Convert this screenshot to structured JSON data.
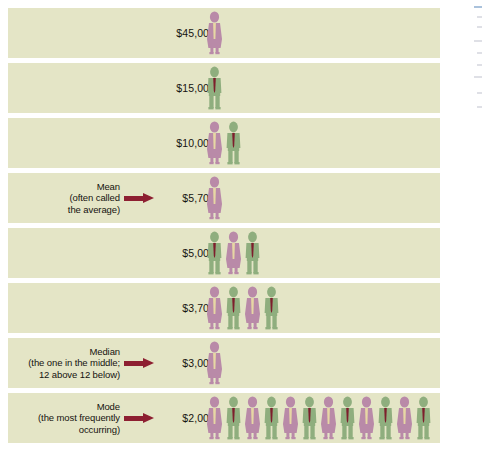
{
  "figure": {
    "name": "mean-median-mode-salary-pictograph",
    "background_color": "#ffffff",
    "band_color": "#e4e5c6",
    "arrow_color": "#8d1f31",
    "female_color": "#b98aa8",
    "female_blouse_color": "#e7d7a4",
    "male_color": "#8fae7e",
    "male_tie_color": "#7d1e2c",
    "text_color": "#15130f"
  },
  "chart_data": {
    "type": "bar",
    "title": "",
    "subtitle": "",
    "xlabel": "",
    "ylabel": "",
    "legend": [],
    "grid": false,
    "note": "Pictograph: each person icon represents one wage earner at the given salary level.",
    "categories": [
      "$45,000",
      "$15,000",
      "$10,000",
      "$5,700",
      "$5,000",
      "$3,700",
      "$3,000",
      "$2,000"
    ],
    "values": [
      1,
      1,
      2,
      1,
      3,
      4,
      1,
      12
    ],
    "series": [
      {
        "name": "Number of people",
        "values": [
          1,
          1,
          2,
          1,
          3,
          4,
          1,
          12
        ]
      }
    ],
    "total_people": 25
  },
  "rows": [
    {
      "id": "row-45000",
      "value": "$45,000",
      "annotation": null,
      "count": 12,
      "people": [
        "female"
      ]
    },
    {
      "id": "row-15000",
      "value": "$15,000",
      "annotation": null,
      "count": 1,
      "people": [
        "male"
      ]
    },
    {
      "id": "row-10000",
      "value": "$10,000",
      "annotation": null,
      "count": 2,
      "people": [
        "female",
        "male"
      ]
    },
    {
      "id": "row-5700",
      "value": "$5,700",
      "annotation": {
        "name": "mean",
        "line1": "Mean",
        "line2": "(often called",
        "line3": "the average)"
      },
      "count": 1,
      "people": [
        "female"
      ]
    },
    {
      "id": "row-5000",
      "value": "$5,000",
      "annotation": null,
      "count": 3,
      "people": [
        "male",
        "female",
        "male"
      ]
    },
    {
      "id": "row-3700",
      "value": "$3,700",
      "annotation": null,
      "count": 4,
      "people": [
        "female",
        "male",
        "female",
        "male"
      ]
    },
    {
      "id": "row-3000",
      "value": "$3,000",
      "annotation": {
        "name": "median",
        "line1": "Median",
        "line2": "(the one in the middle;",
        "line3": "12 above 12 below)"
      },
      "count": 1,
      "people": [
        "female"
      ]
    },
    {
      "id": "row-2000",
      "value": "$2,000",
      "annotation": {
        "name": "mode",
        "line1": "Mode",
        "line2": "(the most frequently",
        "line3": "occurring)"
      },
      "count": 12,
      "people": [
        "female",
        "male",
        "female",
        "male",
        "female",
        "male",
        "female",
        "male",
        "female",
        "male",
        "female",
        "male"
      ]
    }
  ]
}
